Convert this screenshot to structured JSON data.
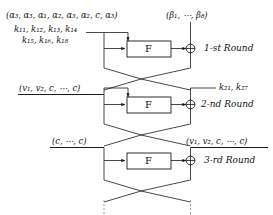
{
  "figure": {
    "type": "feistel-cipher-round-diagram",
    "f_box_label": "F",
    "xor_symbol": "⊕"
  },
  "round1": {
    "left_input_tuple": "(α₃, α₃, α₁, α₂, α₃, α₂, c, α₃)",
    "right_input_tuple": "(β₁, ⋯, β₈)",
    "keys_line1": "k₁₁, k₁₂, k₁₃, k₁₄",
    "keys_line2": "k₁₅, k₁₆, k₁₈",
    "round_label": "1-st Round",
    "f_label": "F"
  },
  "round2": {
    "left_input_tuple": "(v₁, v₂, c, ⋯, c)",
    "keys": "k₂₁, k₂₇",
    "round_label": "2-nd Round",
    "f_label": "F"
  },
  "round3": {
    "left_input_tuple": "(c, ⋯, c)",
    "right_input_tuple": "(v₁, v₂, c, ⋯, c)",
    "round_label": "3-rd Round",
    "f_label": "F"
  },
  "colors": {
    "line": "#1a1a1a",
    "dashed_line": "#8a8a8a",
    "text": "#111111",
    "background": "#ffffff"
  }
}
